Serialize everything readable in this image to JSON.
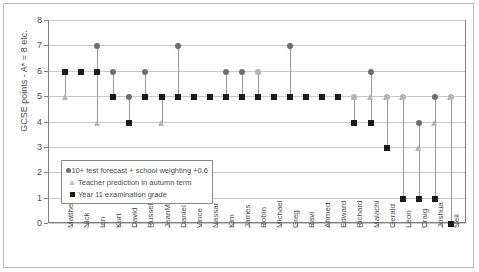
{
  "chart_data": {
    "type": "scatter",
    "title": "",
    "xlabel": "",
    "ylabel": "GCSE points - A* = 8 etc.",
    "ylim": [
      0,
      8
    ],
    "yticks": [
      0,
      1,
      2,
      3,
      4,
      5,
      6,
      7,
      8
    ],
    "grid": true,
    "legend_position": "inside-bottom-left",
    "categories": [
      "Matthew",
      "Nick",
      "Ian",
      "Kurt",
      "David",
      "Russell",
      "JeanMarc",
      "Daniel",
      "Vince",
      "Nassar",
      "Kim",
      "James",
      "Robin",
      "Michael",
      "Greg",
      "Ravi",
      "Ahmed",
      "Edward",
      "Richard",
      "Malachi",
      "Gerald",
      "Leon",
      "Craig",
      "Joshua",
      "Neil"
    ],
    "series": [
      {
        "name": "10+ test forecast + school weighting +0.6",
        "marker": "circle",
        "color": "#6e6e6e",
        "values": [
          6,
          6,
          7,
          6,
          5,
          6,
          5,
          7,
          5,
          5,
          6,
          6,
          6,
          5,
          7,
          5,
          5,
          5,
          5,
          6,
          5,
          5,
          4,
          5,
          5
        ]
      },
      {
        "name": "Teacher prediction in autumn term",
        "marker": "triangle",
        "color": "#b5b5b5",
        "values": [
          5,
          6,
          4,
          5,
          4,
          5,
          4,
          5,
          5,
          5,
          5,
          5,
          6,
          5,
          5,
          5,
          5,
          5,
          5,
          5,
          5,
          5,
          3,
          4,
          5
        ]
      },
      {
        "name": "Year 11 examination grade",
        "marker": "square",
        "color": "#1a1a1a",
        "values": [
          6,
          6,
          6,
          5,
          4,
          5,
          5,
          5,
          5,
          5,
          5,
          5,
          5,
          5,
          5,
          5,
          5,
          5,
          4,
          4,
          3,
          1,
          1,
          1,
          0
        ]
      }
    ]
  },
  "legend": {
    "items": [
      {
        "label": "10+ test forecast + school weighting +0.6",
        "marker": "circle-icon"
      },
      {
        "label": "Teacher prediction in autumn term",
        "marker": "triangle-icon"
      },
      {
        "label": "Year 11 examination grade",
        "marker": "square-icon"
      }
    ]
  },
  "axis": {
    "y_title": "GCSE points - A* = 8 etc.",
    "y_ticks": [
      "8",
      "7",
      "6",
      "5",
      "4",
      "3",
      "2",
      "1",
      "0"
    ]
  }
}
